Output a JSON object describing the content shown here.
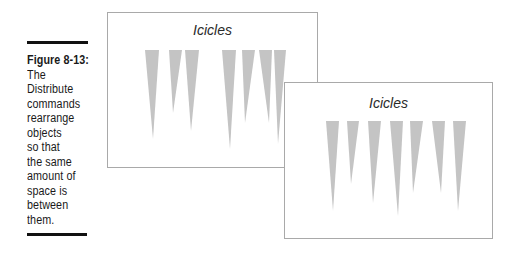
{
  "caption": {
    "figure_label": "Figure 8-13:",
    "lines": [
      "The",
      "Distribute",
      "commands",
      "rearrange",
      "objects",
      "so that",
      "the same",
      "amount of",
      "space is",
      "between",
      "them."
    ]
  },
  "colors": {
    "icicle": "#c4c4c4",
    "slide_border": "#a9a9a9",
    "rule": "#111111"
  },
  "slides": [
    {
      "name": "before-distribute",
      "title": "Icicles",
      "icicles": [
        {
          "x1": 37,
          "x2": 51,
          "top": 37,
          "tip_x": 45,
          "tip_y": 126
        },
        {
          "x1": 61,
          "x2": 74,
          "top": 37,
          "tip_x": 65,
          "tip_y": 100
        },
        {
          "x1": 77,
          "x2": 91,
          "top": 37,
          "tip_x": 83,
          "tip_y": 118
        },
        {
          "x1": 114,
          "x2": 128,
          "top": 37,
          "tip_x": 122,
          "tip_y": 136
        },
        {
          "x1": 134,
          "x2": 147,
          "top": 37,
          "tip_x": 137,
          "tip_y": 110
        },
        {
          "x1": 151,
          "x2": 164,
          "top": 37,
          "tip_x": 161,
          "tip_y": 110
        },
        {
          "x1": 166,
          "x2": 178,
          "top": 37,
          "tip_x": 170,
          "tip_y": 131
        }
      ]
    },
    {
      "name": "after-distribute",
      "title": "Icicles",
      "icicles": [
        {
          "x1": 41,
          "x2": 54,
          "top": 38,
          "tip_x": 48,
          "tip_y": 128
        },
        {
          "x1": 62,
          "x2": 74,
          "top": 38,
          "tip_x": 66,
          "tip_y": 101
        },
        {
          "x1": 83,
          "x2": 96,
          "top": 38,
          "tip_x": 88,
          "tip_y": 120
        },
        {
          "x1": 105,
          "x2": 118,
          "top": 38,
          "tip_x": 113,
          "tip_y": 133
        },
        {
          "x1": 125,
          "x2": 138,
          "top": 38,
          "tip_x": 128,
          "tip_y": 110
        },
        {
          "x1": 147,
          "x2": 160,
          "top": 38,
          "tip_x": 156,
          "tip_y": 110
        },
        {
          "x1": 168,
          "x2": 181,
          "top": 38,
          "tip_x": 173,
          "tip_y": 128
        }
      ]
    }
  ]
}
